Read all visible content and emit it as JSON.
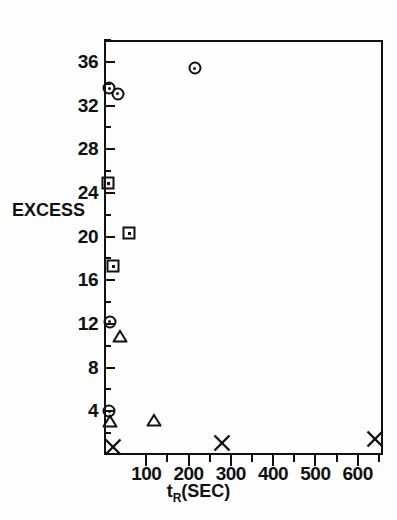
{
  "chart_data": {
    "type": "scatter",
    "title": "",
    "xlabel": "t_R (SEC)",
    "xlabel_main": "t",
    "xlabel_sub": "R",
    "xlabel_unit": "(SEC)",
    "ylabel": "EXCESS",
    "xlim": [
      0,
      660
    ],
    "ylim": [
      0,
      38
    ],
    "grid": false,
    "legend": "none",
    "x_ticks": [
      100,
      200,
      300,
      400,
      500,
      600
    ],
    "x_tick_labels": [
      "100",
      "200",
      "300",
      "400",
      "500",
      "600"
    ],
    "x_minor_ticks": [
      150,
      250,
      350,
      450,
      550,
      650
    ],
    "y_ticks": [
      36,
      32,
      28,
      24,
      20,
      16,
      12,
      8,
      4
    ],
    "y_tick_labels": [
      "36",
      "32",
      "28",
      "24",
      "20",
      "16",
      "12",
      "8",
      "4"
    ],
    "y_minor_ticks": [
      38,
      34,
      30,
      26,
      22,
      18,
      14,
      10,
      6,
      2
    ],
    "series": [
      {
        "name": "circle",
        "marker": "circle-dot",
        "points": [
          {
            "x": 215,
            "y": 35.4
          },
          {
            "x": 12,
            "y": 33.6
          },
          {
            "x": 32,
            "y": 33.1
          },
          {
            "x": 14,
            "y": 12.2
          },
          {
            "x": 12,
            "y": 4.0
          }
        ]
      },
      {
        "name": "square",
        "marker": "square-dot",
        "points": [
          {
            "x": 10,
            "y": 24.9
          },
          {
            "x": 60,
            "y": 20.3
          },
          {
            "x": 22,
            "y": 17.3
          }
        ]
      },
      {
        "name": "triangle",
        "marker": "triangle",
        "points": [
          {
            "x": 38,
            "y": 10.9
          },
          {
            "x": 14,
            "y": 3.1
          },
          {
            "x": 118,
            "y": 3.2
          }
        ]
      },
      {
        "name": "cross",
        "marker": "x",
        "points": [
          {
            "x": 22,
            "y": 0.7
          },
          {
            "x": 280,
            "y": 1.1
          },
          {
            "x": 640,
            "y": 1.5
          }
        ]
      }
    ]
  }
}
